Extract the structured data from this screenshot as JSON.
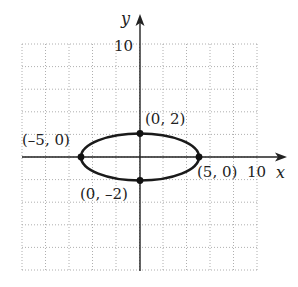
{
  "chart_data": {
    "type": "line",
    "title": "",
    "xlabel": "x",
    "ylabel": "y",
    "xlim": [
      -10,
      10
    ],
    "ylim": [
      -10,
      10
    ],
    "grid": true,
    "grid_spacing": 2,
    "grid_style": "dotted",
    "tick_labels": {
      "x": "10",
      "y": "10"
    },
    "curve": {
      "kind": "ellipse",
      "equation": "x^2/25 + y^2/4 = 1",
      "center": [
        0,
        0
      ],
      "semi_major_x": 5,
      "semi_minor_y": 2
    },
    "points": [
      {
        "x": 0,
        "y": 2,
        "label": "(0, 2)"
      },
      {
        "x": 0,
        "y": -2,
        "label": "(0, –2)"
      },
      {
        "x": -5,
        "y": 0,
        "label": "(–5, 0)"
      },
      {
        "x": 5,
        "y": 0,
        "label": "(5, 0)"
      }
    ],
    "colors": {
      "axis": "#222222",
      "curve": "#1a1a1a",
      "grid": "#9a9a9a"
    }
  }
}
